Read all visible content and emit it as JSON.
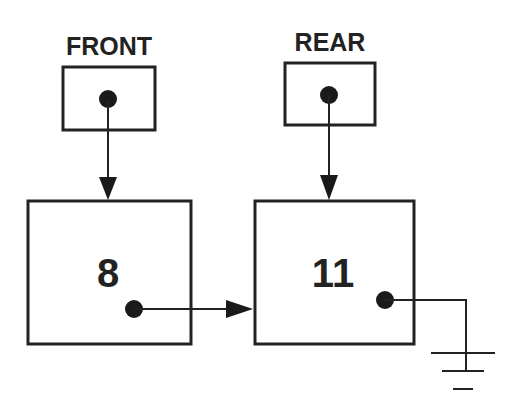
{
  "diagram": {
    "front_pointer": {
      "label": "FRONT",
      "points_to": "node-1"
    },
    "rear_pointer": {
      "label": "REAR",
      "points_to": "node-2"
    },
    "nodes": [
      {
        "id": "node-1",
        "value": "8",
        "next": "node-2"
      },
      {
        "id": "node-2",
        "value": "11",
        "next": "null (ground symbol)"
      }
    ],
    "colors": {
      "stroke": "#222222",
      "background": "#ffffff"
    }
  }
}
